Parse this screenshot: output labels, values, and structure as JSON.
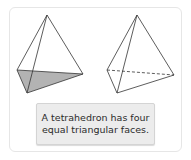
{
  "figure": {
    "caption_lines": [
      "A tetrahedron has four",
      "equal triangular faces."
    ],
    "colors": {
      "stroke": "#333333",
      "shaded_face": "#b3b3b3",
      "caption_bg": "#ececec",
      "card_border": "#e6e6e6"
    },
    "shapes": [
      {
        "name": "tetrahedron-shaded-base",
        "note": "base face shaded"
      },
      {
        "name": "tetrahedron-dashed-edge",
        "note": "hidden edge dashed"
      }
    ]
  }
}
